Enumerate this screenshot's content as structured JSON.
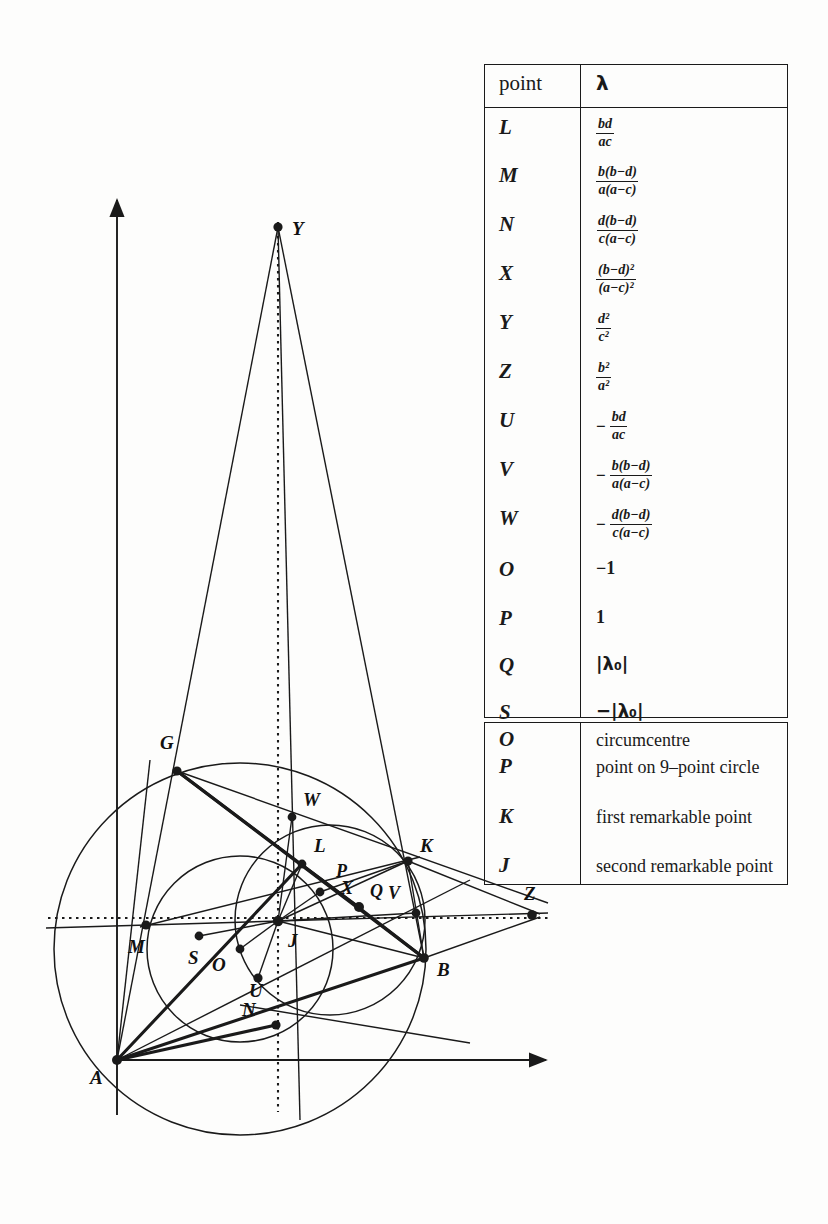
{
  "figure": {
    "axes": {
      "x_axis_label": "",
      "y_axis_label": "",
      "origin_point": "A"
    },
    "points": [
      {
        "name": "Y",
        "label": "Y",
        "x": 278,
        "y": 227,
        "lx": 292,
        "ly": 219
      },
      {
        "name": "G",
        "label": "G",
        "x": 177,
        "y": 771,
        "lx": 160,
        "ly": 735
      },
      {
        "name": "W",
        "label": "W",
        "x": 292,
        "y": 817,
        "lx": 303,
        "ly": 792
      },
      {
        "name": "L",
        "label": "L",
        "x": 302,
        "y": 864,
        "lx": 313,
        "ly": 838
      },
      {
        "name": "K",
        "label": "K",
        "x": 408,
        "y": 861,
        "lx": 420,
        "ly": 838
      },
      {
        "name": "P",
        "label": "P",
        "x": 320,
        "y": 892,
        "lx": 336,
        "ly": 866
      },
      {
        "name": "X",
        "label": "X",
        "x": 358,
        "y": 907,
        "lx": 342,
        "ly": 883
      },
      {
        "name": "Q",
        "label": "Q",
        "x": 358,
        "y": 907,
        "lx": 372,
        "ly": 885
      },
      {
        "name": "V",
        "label": "V",
        "x": 415,
        "y": 913,
        "lx": 389,
        "ly": 887
      },
      {
        "name": "Z",
        "label": "Z",
        "x": 532,
        "y": 915,
        "lx": 525,
        "ly": 887
      },
      {
        "name": "M",
        "label": "M",
        "x": 146,
        "y": 925,
        "lx": 131,
        "ly": 940
      },
      {
        "name": "J",
        "label": "J",
        "x": 278,
        "y": 921,
        "lx": 288,
        "ly": 935
      },
      {
        "name": "S",
        "label": "S",
        "x": 199,
        "y": 936,
        "lx": 189,
        "ly": 951
      },
      {
        "name": "O",
        "label": "O",
        "x": 240,
        "y": 949,
        "lx": 213,
        "ly": 957
      },
      {
        "name": "B",
        "label": "B",
        "x": 424,
        "y": 958,
        "lx": 437,
        "ly": 963
      },
      {
        "name": "U",
        "label": "U",
        "x": 258,
        "y": 978,
        "lx": 250,
        "ly": 983
      },
      {
        "name": "N",
        "label": "N",
        "x": 276,
        "y": 1025,
        "lx": 243,
        "ly": 1003
      },
      {
        "name": "A",
        "label": "A",
        "x": 117,
        "y": 1060,
        "lx": 92,
        "ly": 1070
      }
    ]
  },
  "table_lambda": {
    "headers": {
      "point": "point",
      "lambda": "λ"
    },
    "rows": [
      {
        "point": "L",
        "type": "frac",
        "num": "bd",
        "den": "ac",
        "sign": ""
      },
      {
        "point": "M",
        "type": "frac",
        "num": "b(b−d)",
        "den": "a(a−c)",
        "sign": ""
      },
      {
        "point": "N",
        "type": "frac",
        "num": "d(b−d)",
        "den": "c(a−c)",
        "sign": ""
      },
      {
        "point": "X",
        "type": "frac",
        "num": "(b−d)²",
        "den": "(a−c)²",
        "sign": ""
      },
      {
        "point": "Y",
        "type": "frac",
        "num": "d²",
        "den": "c²",
        "sign": ""
      },
      {
        "point": "Z",
        "type": "frac",
        "num": "b²",
        "den": "a²",
        "sign": ""
      },
      {
        "point": "U",
        "type": "frac",
        "num": "bd",
        "den": "ac",
        "sign": "−"
      },
      {
        "point": "V",
        "type": "frac",
        "num": "b(b−d)",
        "den": "a(a−c)",
        "sign": "−"
      },
      {
        "point": "W",
        "type": "frac",
        "num": "d(b−d)",
        "den": "c(a−c)",
        "sign": "−"
      },
      {
        "point": "O",
        "type": "plain",
        "text": "−1"
      },
      {
        "point": "P",
        "type": "plain",
        "text": "1"
      },
      {
        "point": "Q",
        "type": "abs",
        "text": "|λ₀|"
      },
      {
        "point": "S",
        "type": "abs",
        "text": "−|λ₀|"
      }
    ]
  },
  "table_desc": {
    "rows": [
      {
        "point": "O",
        "desc": "circumcentre"
      },
      {
        "point": "P",
        "desc": "point on 9–point circle"
      },
      {
        "point": "K",
        "desc": "first remarkable point"
      },
      {
        "point": "J",
        "desc": "second remarkable point"
      }
    ]
  }
}
